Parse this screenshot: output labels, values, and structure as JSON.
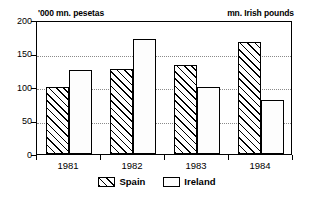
{
  "chart_data": {
    "type": "bar",
    "title": "",
    "subtitle": "",
    "left_axis_title": "'000 mn. pesetas",
    "right_axis_title": "mn. Irish pounds",
    "xlabel": "",
    "ylabel": "",
    "categories": [
      "1981",
      "1982",
      "1983",
      "1984"
    ],
    "series": [
      {
        "name": "Spain",
        "values": [
          100,
          127,
          133,
          167
        ],
        "pattern": "diagonal-hatch",
        "color": "#000000"
      },
      {
        "name": "Ireland",
        "values": [
          126,
          171,
          100,
          81
        ],
        "pattern": "stipple-dots",
        "color": "#555555"
      }
    ],
    "ylim": [
      0,
      200
    ],
    "yticks": [
      0,
      50,
      100,
      150,
      200
    ],
    "ytick_labels": [
      "0",
      "50",
      "100",
      "150",
      "200"
    ],
    "grid": true,
    "grid_style": "dotted",
    "legend_position": "bottom-center"
  },
  "legend": {
    "items": [
      {
        "label": "Spain"
      },
      {
        "label": "Ireland"
      }
    ]
  }
}
